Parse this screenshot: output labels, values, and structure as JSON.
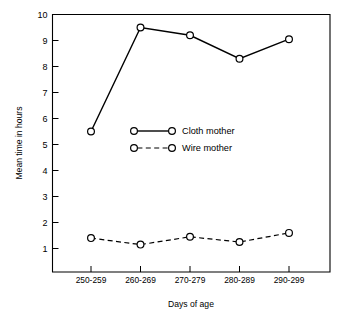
{
  "chart_data": {
    "type": "line",
    "title": "",
    "xlabel": "Days of age",
    "ylabel": "Mean time in hours",
    "categories": [
      "250-259",
      "260-269",
      "270-279",
      "280-289",
      "290-299"
    ],
    "ylim": [
      0,
      10
    ],
    "ytick_labels": [
      "1",
      "2",
      "3",
      "4",
      "5",
      "6",
      "7",
      "8",
      "9",
      "10"
    ],
    "ytick_values": [
      1,
      2,
      3,
      4,
      5,
      6,
      7,
      8,
      9,
      10
    ],
    "grid": false,
    "legend_position": "center",
    "series": [
      {
        "name": "Cloth mother",
        "style": "solid",
        "marker": "open-circle",
        "values": [
          5.5,
          9.5,
          9.2,
          8.3,
          9.05
        ]
      },
      {
        "name": "Wire mother",
        "style": "dashed",
        "marker": "open-circle",
        "values": [
          1.4,
          1.15,
          1.45,
          1.25,
          1.6
        ]
      }
    ]
  },
  "legend": {
    "entries": [
      {
        "label": "Cloth mother"
      },
      {
        "label": "Wire mother"
      }
    ]
  },
  "colors": {
    "ink": "#000000",
    "background": "#ffffff"
  }
}
